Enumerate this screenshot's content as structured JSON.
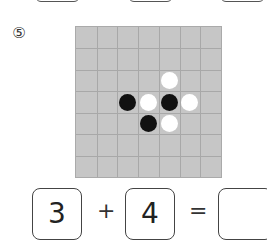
{
  "problem": {
    "number": "⑤",
    "board": {
      "rows": 7,
      "cols": 7,
      "stones": [
        {
          "row": 2,
          "col": 4,
          "color": "white"
        },
        {
          "row": 3,
          "col": 2,
          "color": "black"
        },
        {
          "row": 3,
          "col": 3,
          "color": "white"
        },
        {
          "row": 3,
          "col": 4,
          "color": "black"
        },
        {
          "row": 3,
          "col": 5,
          "color": "white"
        },
        {
          "row": 4,
          "col": 3,
          "color": "black"
        },
        {
          "row": 4,
          "col": 4,
          "color": "white"
        }
      ]
    },
    "equation": {
      "operand1": "3",
      "plus": "+",
      "operand2": "4",
      "equals": "=",
      "answer": ""
    }
  }
}
